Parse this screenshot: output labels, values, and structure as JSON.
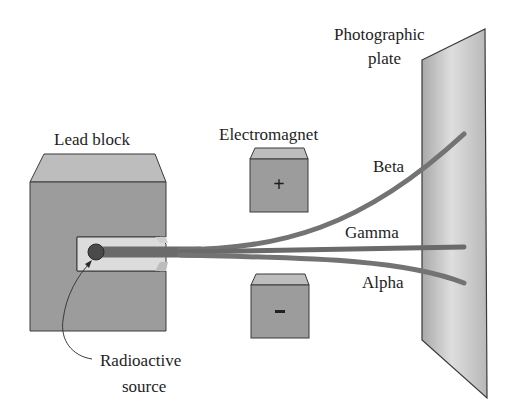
{
  "diagram": {
    "labels": {
      "lead_block": "Lead block",
      "electromagnet": "Electromagnet",
      "photographic_plate_line1": "Photographic",
      "photographic_plate_line2": "plate",
      "beta": "Beta",
      "gamma": "Gamma",
      "alpha": "Alpha",
      "source_line1": "Radioactive",
      "source_line2": "source"
    },
    "magnet_polarity": {
      "top": "+",
      "bottom": "–"
    },
    "colors": {
      "background": "#ffffff",
      "block_front": "#9c9c9c",
      "block_top": "#bdbdbd",
      "slot": "#dcdcdc",
      "source_dot": "#4a4a4a",
      "ray": "#6e6e6e",
      "plate_light": "#d9d9d9",
      "plate_dark": "#a8a8a8",
      "outline": "#3a3a3a",
      "text": "#1e1e1e"
    }
  }
}
